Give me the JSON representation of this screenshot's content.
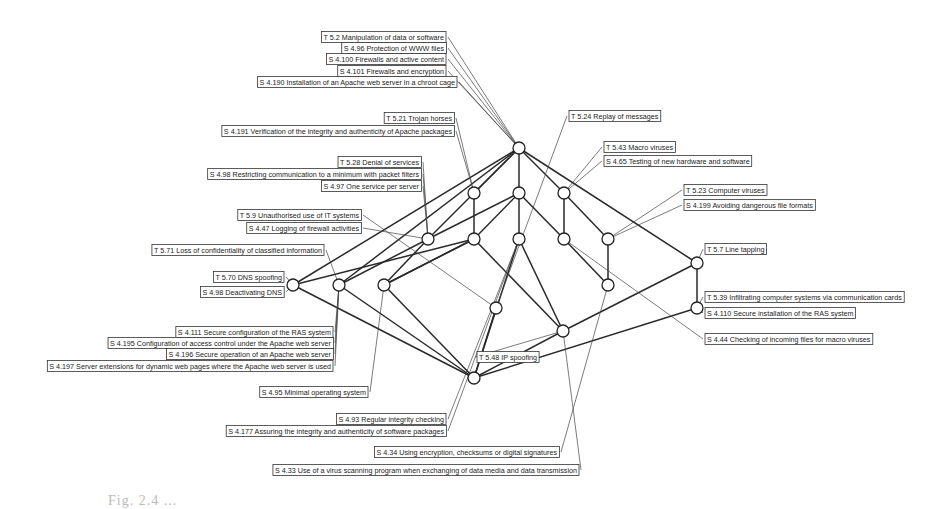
{
  "figure": {
    "type": "concept-lattice",
    "caption": "Fig. 2.4 ..."
  },
  "labels": [
    {
      "id": "t52",
      "text": "T 5.2 Manipulation of data or software"
    },
    {
      "id": "s496",
      "text": "S 4.96 Protection of WWW files"
    },
    {
      "id": "s4100",
      "text": "S 4.100 Firewalls and active content"
    },
    {
      "id": "s4101",
      "text": "S 4.101 Firewalls and encryption"
    },
    {
      "id": "s4190",
      "text": "S 4.190 Installation of an Apache web server in a chroot cage"
    },
    {
      "id": "t521",
      "text": "T 5.21 Trojan horses"
    },
    {
      "id": "s4191",
      "text": "S 4.191 Verification of the integrity and authenticity of Apache packages"
    },
    {
      "id": "t524",
      "text": "T 5.24 Replay of messages"
    },
    {
      "id": "t528",
      "text": "T 5.28 Denial of services"
    },
    {
      "id": "s498",
      "text": "S 4.98 Restricting communication to a minimum with packet filters"
    },
    {
      "id": "s497",
      "text": "S 4.97 One service per server"
    },
    {
      "id": "t543",
      "text": "T 5.43 Macro viruses"
    },
    {
      "id": "s465",
      "text": "S 4.65 Testing of new hardware and software"
    },
    {
      "id": "t523",
      "text": "T 5.23 Computer viruses"
    },
    {
      "id": "s4199",
      "text": "S 4.199 Avoiding dangerous file formats"
    },
    {
      "id": "t59",
      "text": "T 5.9 Unauthorised use of IT systems"
    },
    {
      "id": "s447",
      "text": "S 4.47 Logging of firewall activities"
    },
    {
      "id": "t571",
      "text": "T 5.71 Loss of confidentiality of classified information"
    },
    {
      "id": "t570",
      "text": "T 5.70 DNS spoofing"
    },
    {
      "id": "s498b",
      "text": "S 4.98 Deactivating DNS"
    },
    {
      "id": "t57",
      "text": "T 5.7 Line tapping"
    },
    {
      "id": "t539",
      "text": "T 5.39 Infiltrating computer systems via communication cards"
    },
    {
      "id": "s4110",
      "text": "S 4.110 Secure installation of the RAS system"
    },
    {
      "id": "s444",
      "text": "S 4.44 Checking of incoming files for macro viruses"
    },
    {
      "id": "s4111",
      "text": "S 4.111 Secure configuration of the RAS system"
    },
    {
      "id": "s4195",
      "text": "S 4.195 Configuration of access control under the Apache web server"
    },
    {
      "id": "s4196",
      "text": "S 4.196 Secure operation of an Apache web server"
    },
    {
      "id": "s4197",
      "text": "S 4.197 Server extensions for dynamic web pages where the Apache web server is used"
    },
    {
      "id": "t548",
      "text": "T 5.48 IP spoofing"
    },
    {
      "id": "s495",
      "text": "S 4.95 Minimal operating system"
    },
    {
      "id": "s493",
      "text": "S 4.93 Regular integrity checking"
    },
    {
      "id": "s4177",
      "text": "S 4.177 Assuring the integrity and authenticity of software packages"
    },
    {
      "id": "s434",
      "text": "S 4.34 Using encryption, checksums or digital signatures"
    },
    {
      "id": "s433",
      "text": "S 4.33 Use of a virus scanning program when exchanging of data media and data transmission"
    }
  ]
}
